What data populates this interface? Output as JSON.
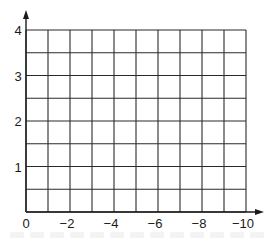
{
  "chart_data": {
    "type": "line",
    "title": "",
    "xlabel": "",
    "ylabel": "",
    "x_ticks": [
      0,
      -2,
      -4,
      -6,
      -8,
      -10
    ],
    "x_tick_labels": [
      "0",
      "−2",
      "−4",
      "−6",
      "−8",
      "−10"
    ],
    "y_ticks": [
      1,
      2,
      3,
      4
    ],
    "y_tick_labels": [
      "1",
      "2",
      "3",
      "4"
    ],
    "xlim": [
      0,
      -10
    ],
    "ylim": [
      0,
      4
    ],
    "x_grid_step": 1,
    "y_grid_step": 0.5,
    "grid": true,
    "legend": null,
    "series": []
  },
  "colors": {
    "background": "#ffffff",
    "grid": "#2a2a2a",
    "axis": "#1a1a1a",
    "text": "#1a1a1a"
  }
}
